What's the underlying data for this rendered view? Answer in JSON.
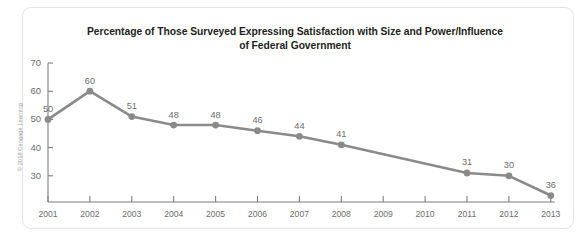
{
  "attribution": "© 2018 Cengage Learning",
  "chart_data": {
    "type": "line",
    "title_line1": "Percentage of Those Surveyed Expressing Satisfaction with Size and Power/Influence",
    "title_line2": "of Federal Government",
    "xlabel": "",
    "ylabel": "",
    "categories": [
      "2001",
      "2002",
      "2003",
      "2004",
      "2005",
      "2006",
      "2007",
      "2008",
      "2009",
      "2010",
      "2011",
      "2012",
      "2013"
    ],
    "values": [
      50,
      60,
      51,
      48,
      48,
      46,
      44,
      41,
      null,
      null,
      31,
      30,
      23
    ],
    "point_labels": [
      "50",
      "60",
      "51",
      "48",
      "48",
      "46",
      "44",
      "41",
      "",
      "",
      "31",
      "30",
      "36"
    ],
    "ytick_labels": [
      "70",
      "60",
      "50",
      "40",
      "30"
    ],
    "ytick_values": [
      70,
      60,
      50,
      40,
      30
    ],
    "ylim": [
      20,
      70
    ],
    "grid": false,
    "legend": "none",
    "series_color": "#8a8a8a",
    "axis_color": "#7d7d7d",
    "label_color": "#6d6d6d"
  }
}
